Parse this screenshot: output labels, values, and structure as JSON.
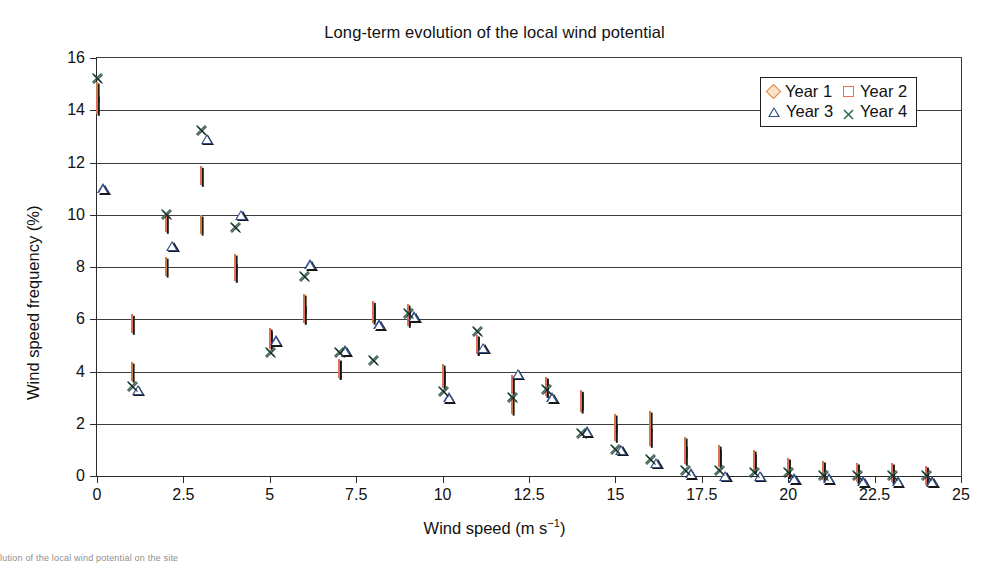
{
  "figure": {
    "title": "Long-term evolution of the local wind potential",
    "bottom_caption_fragment": "lution of the local wind potential on the site"
  },
  "axes": {
    "x_title_main": "Wind speed (m s",
    "x_title_sup": "−1",
    "x_title_tail": ")",
    "x_title_full": "Wind speed (m s−1)",
    "y_title": "Wind speed frequency (%)",
    "x_ticks": [
      "0",
      "2.5",
      "5",
      "7.5",
      "10",
      "12.5",
      "15",
      "17.5",
      "20",
      "22.5",
      "25"
    ],
    "y_ticks": [
      "0",
      "2",
      "4",
      "6",
      "8",
      "10",
      "12",
      "14",
      "16"
    ]
  },
  "legend": {
    "entries": [
      {
        "label": "Year 1",
        "marker": "diamond-marker",
        "color": "#d9874a"
      },
      {
        "label": "Year 2",
        "marker": "square-marker",
        "color": "#e8705a"
      },
      {
        "label": "Year 3",
        "marker": "triangle-marker",
        "color": "#2f4f86"
      },
      {
        "label": "Year 4",
        "marker": "cross-marker",
        "color": "#2f6b52"
      }
    ]
  },
  "chart_data": {
    "type": "scatter",
    "title": "Long-term evolution of the local wind potential",
    "xlabel": "Wind speed (m s−1)",
    "ylabel": "Wind speed frequency (%)",
    "xlim": [
      0,
      25
    ],
    "ylim": [
      0,
      16
    ],
    "xticks": [
      0,
      2.5,
      5,
      7.5,
      10,
      12.5,
      15,
      17.5,
      20,
      22.5,
      25
    ],
    "yticks": [
      0,
      2,
      4,
      6,
      8,
      10,
      12,
      14,
      16
    ],
    "grid": "horizontal",
    "legend_position": "top-right",
    "x": [
      0,
      1,
      2,
      3,
      4,
      5,
      6,
      7,
      8,
      9,
      10,
      11,
      12,
      13,
      14,
      15,
      16,
      17,
      18,
      19,
      20,
      21,
      22,
      23,
      24
    ],
    "series": [
      {
        "name": "Year 1",
        "marker": "diamond",
        "color": "#d9874a",
        "values": [
          14.7,
          4.0,
          8.0,
          9.6,
          8.1,
          5.3,
          6.6,
          4.1,
          6.2,
          6.2,
          3.9,
          5.0,
          2.7,
          3.4,
          2.8,
          2.0,
          2.1,
          1.1,
          0.8,
          0.6,
          0.3,
          0.2,
          0.1,
          0.1,
          0.0
        ]
      },
      {
        "name": "Year 2",
        "marker": "square",
        "color": "#e8705a",
        "values": [
          14.2,
          5.8,
          9.7,
          11.5,
          7.8,
          5.2,
          6.2,
          4.1,
          6.3,
          6.1,
          3.7,
          5.0,
          3.5,
          3.4,
          2.9,
          1.7,
          1.5,
          0.8,
          0.7,
          0.5,
          0.3,
          0.2,
          0.1,
          0.1,
          0.0
        ]
      },
      {
        "name": "Year 3",
        "marker": "triangle",
        "color": "#2f4f86",
        "values": [
          11.2,
          3.5,
          9.0,
          13.1,
          10.2,
          5.4,
          8.3,
          5.0,
          6.0,
          6.3,
          3.2,
          5.1,
          4.1,
          3.2,
          1.9,
          1.2,
          0.7,
          0.3,
          0.2,
          0.2,
          0.1,
          0.1,
          0.0,
          0.0,
          0.0
        ]
      },
      {
        "name": "Year 4",
        "marker": "cross",
        "color": "#2f6b52",
        "values": [
          15.2,
          3.4,
          10.0,
          13.2,
          9.5,
          4.7,
          7.6,
          4.7,
          4.4,
          6.2,
          3.2,
          5.5,
          3.0,
          3.3,
          1.6,
          1.0,
          0.6,
          0.2,
          0.2,
          0.1,
          0.1,
          0.0,
          0.0,
          0.0,
          0.0
        ]
      }
    ]
  }
}
